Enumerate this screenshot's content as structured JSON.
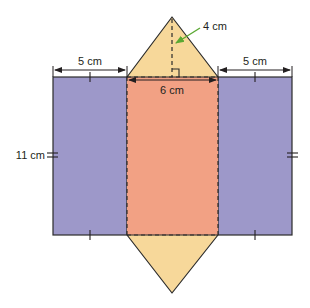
{
  "figure": {
    "labels": {
      "left_width": "5 cm",
      "right_width": "5 cm",
      "center_width": "6 cm",
      "triangle_height": "4 cm",
      "length": "11 cm"
    },
    "colors": {
      "side_faces": "#9d98c9",
      "center_face": "#f2a184",
      "triangle_faces": "#f7d89a",
      "outline": "#2b2b2b",
      "dimension_line": "#231f20",
      "height_pointer": "#5aa832"
    }
  }
}
